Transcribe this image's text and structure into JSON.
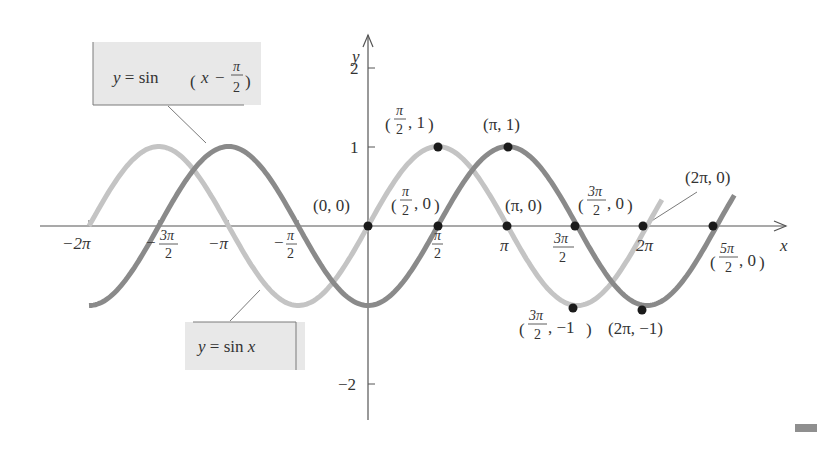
{
  "chart_data": {
    "type": "line",
    "title": "",
    "xlabel": "x",
    "ylabel": "y",
    "xlim": [
      -6.9,
      8.3
    ],
    "ylim": [
      -2.5,
      2.5
    ],
    "grid": false,
    "x_ticks": [
      "-2π",
      "-3π/2",
      "-π",
      "-π/2",
      "π/2",
      "π",
      "3π/2",
      "2π"
    ],
    "y_ticks": [
      "2",
      "1",
      "-2"
    ],
    "series": [
      {
        "name": "y = sin x",
        "color": "#c4c4c4",
        "domain": [
          "-2π",
          "≈2.1π"
        ],
        "key_points": [
          [
            0,
            0
          ],
          [
            1.5708,
            1
          ],
          [
            3.1416,
            0
          ],
          [
            4.7124,
            -1
          ],
          [
            6.2832,
            0
          ]
        ]
      },
      {
        "name": "y = sin(x − π/2)",
        "color": "#8a8a8a",
        "domain": [
          "-2π",
          "≈2.8π"
        ],
        "key_points": [
          [
            1.5708,
            0
          ],
          [
            3.1416,
            1
          ],
          [
            4.7124,
            0
          ],
          [
            6.2832,
            -1
          ],
          [
            7.854,
            0
          ]
        ]
      }
    ],
    "annotations": [
      "(0, 0)",
      "(π/2, 1)",
      "(π/2, 0)",
      "(π, 1)",
      "(π, 0)",
      "(3π/2, 0)",
      "(2π, 0)",
      "(5π/2, 0)",
      "(3π/2, −1)",
      "(2π, −1)"
    ],
    "legend": {
      "callout_top": "y = sin(x − π/2)",
      "callout_bottom": "y = sin x"
    }
  },
  "labels": {
    "axis_x": "x",
    "axis_y": "y",
    "tick_y2": "2",
    "tick_y1": "1",
    "tick_ym2": "−2",
    "tick_m2pi": "−2π",
    "tick_mpi": "−π",
    "tick_pi": "π",
    "tick_2pi": "2π",
    "pt_origin": "(0, 0)",
    "pt_pi_0": "(π, 0)",
    "pt_pi_1": "(π, 1)",
    "pt_2pi_0": "(2π, 0)",
    "pt_2pi_m1": "(2π, −1)",
    "eq_top_prefix": "y = sin",
    "eq_bottom": "y = sin x"
  }
}
